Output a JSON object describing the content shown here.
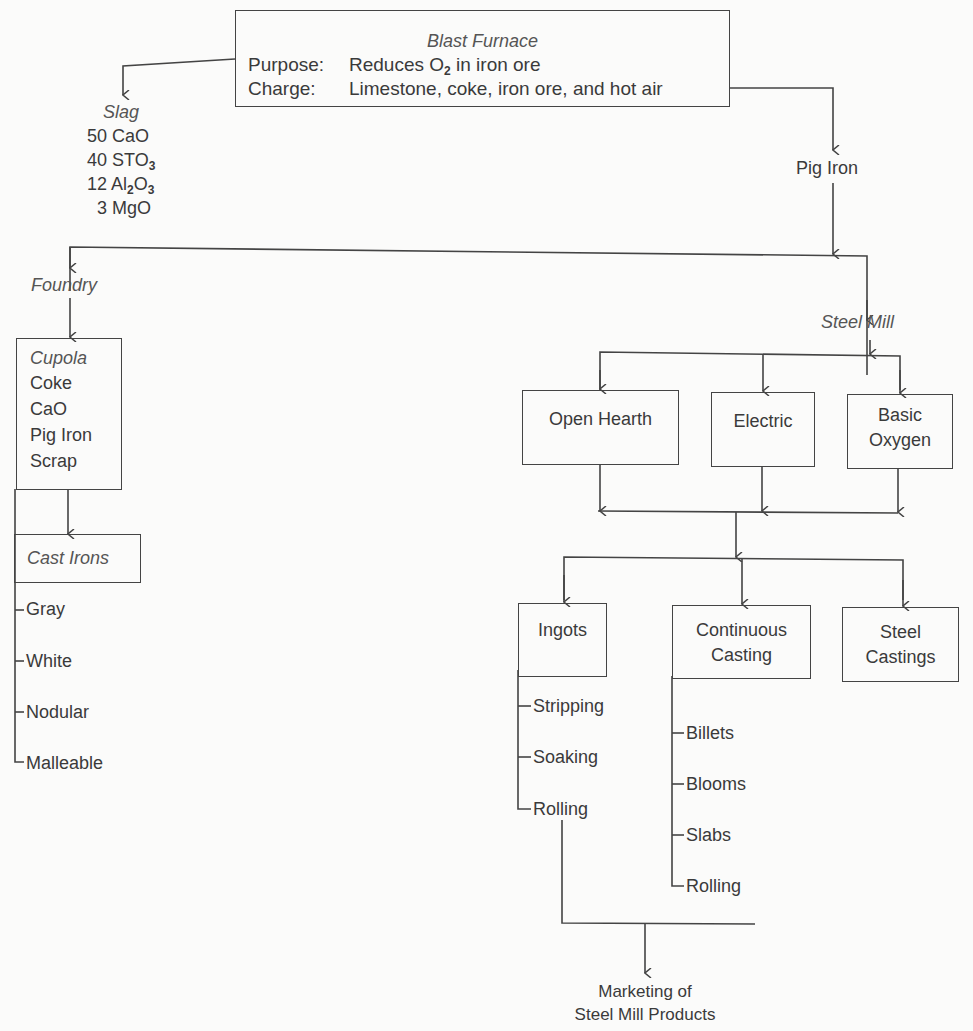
{
  "blast_furnace": {
    "title": "Blast Furnace",
    "purpose_label": "Purpose:",
    "purpose_value_pre": "Reduces O",
    "purpose_value_sub": "2",
    "purpose_value_post": " in iron ore",
    "charge_label": "Charge:",
    "charge_value": "Limestone, coke, iron ore, and hot air"
  },
  "slag": {
    "title": "Slag",
    "items": [
      {
        "amount": "50",
        "formula_parts": [
          "CaO"
        ]
      },
      {
        "amount": "40",
        "formula_parts": [
          "STO",
          "3",
          ""
        ]
      },
      {
        "amount": "12",
        "formula_parts": [
          "Al",
          "2",
          "O",
          "3",
          ""
        ]
      },
      {
        "amount": "3",
        "formula_parts": [
          "MgO"
        ]
      }
    ],
    "line1": "50 CaO",
    "line2_pre": "40 STO",
    "line2_sub": "3",
    "line3_pre": "12 Al",
    "line3_sub1": "2",
    "line3_mid": "O",
    "line3_sub2": "3",
    "line4": "3 MgO"
  },
  "pig_iron": {
    "label": "Pig Iron"
  },
  "foundry": {
    "label": "Foundry",
    "cupola": {
      "title": "Cupola",
      "items": [
        "Coke",
        "CaO",
        "Pig Iron",
        "Scrap"
      ]
    },
    "cast_irons": {
      "title": "Cast Irons",
      "items": [
        "Gray",
        "White",
        "Nodular",
        "Malleable"
      ]
    }
  },
  "steel_mill": {
    "label": "Steel Mill",
    "furnaces": [
      {
        "line1": "Open Hearth",
        "line2": ""
      },
      {
        "line1": "Electric",
        "line2": ""
      },
      {
        "line1": "Basic",
        "line2": "Oxygen"
      }
    ],
    "casting": [
      {
        "line1": "Ingots",
        "line2": "",
        "steps": [
          "Stripping",
          "Soaking",
          "Rolling"
        ]
      },
      {
        "line1": "Continuous",
        "line2": "Casting",
        "steps": [
          "Billets",
          "Blooms",
          "Slabs",
          "Rolling"
        ]
      },
      {
        "line1": "Steel",
        "line2": "Castings",
        "steps": []
      }
    ]
  },
  "marketing": {
    "line1": "Marketing of",
    "line2": "Steel Mill Products"
  }
}
